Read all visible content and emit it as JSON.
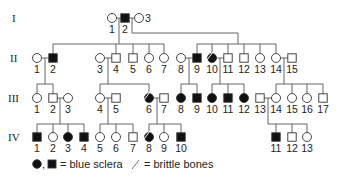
{
  "colors": {
    "affected": "#111111",
    "unaffected": "#ffffff",
    "line": "#555555",
    "text": "#222222"
  },
  "generations": [
    {
      "label": "I",
      "y": 18,
      "individuals": [
        {
          "id": "1",
          "sex": "female",
          "x": 112,
          "affected": false,
          "brittle": false
        },
        {
          "id": "2",
          "sex": "male",
          "x": 125,
          "affected": true,
          "brittle": false
        },
        {
          "id": "3",
          "sex": "female",
          "x": 139,
          "affected": false,
          "brittle": false,
          "label_side": "right"
        }
      ]
    },
    {
      "label": "II",
      "y": 58,
      "individuals": [
        {
          "id": "1",
          "sex": "female",
          "x": 37,
          "affected": false,
          "brittle": false
        },
        {
          "id": "2",
          "sex": "male",
          "x": 53,
          "affected": true,
          "brittle": false
        },
        {
          "id": "3",
          "sex": "female",
          "x": 100,
          "affected": false,
          "brittle": false
        },
        {
          "id": "4",
          "sex": "male",
          "x": 116,
          "affected": false,
          "brittle": false
        },
        {
          "id": "5",
          "sex": "male",
          "x": 133,
          "affected": false,
          "brittle": false
        },
        {
          "id": "6",
          "sex": "female",
          "x": 149,
          "affected": false,
          "brittle": false
        },
        {
          "id": "7",
          "sex": "female",
          "x": 164,
          "affected": false,
          "brittle": false
        },
        {
          "id": "8",
          "sex": "female",
          "x": 181,
          "affected": false,
          "brittle": false
        },
        {
          "id": "9",
          "sex": "male",
          "x": 197,
          "affected": true,
          "brittle": false
        },
        {
          "id": "10",
          "sex": "female",
          "x": 212,
          "affected": true,
          "brittle": true
        },
        {
          "id": "11",
          "sex": "male",
          "x": 228,
          "affected": false,
          "brittle": false
        },
        {
          "id": "12",
          "sex": "male",
          "x": 244,
          "affected": false,
          "brittle": false
        },
        {
          "id": "13",
          "sex": "female",
          "x": 260,
          "affected": false,
          "brittle": false
        },
        {
          "id": "14",
          "sex": "female",
          "x": 276,
          "affected": false,
          "brittle": false
        },
        {
          "id": "15",
          "sex": "male",
          "x": 292,
          "affected": false,
          "brittle": false
        }
      ]
    },
    {
      "label": "III",
      "y": 98,
      "individuals": [
        {
          "id": "1",
          "sex": "female",
          "x": 37,
          "affected": false,
          "brittle": false
        },
        {
          "id": "2",
          "sex": "male",
          "x": 53,
          "affected": false,
          "brittle": false
        },
        {
          "id": "3",
          "sex": "female",
          "x": 68,
          "affected": false,
          "brittle": false
        },
        {
          "id": "4",
          "sex": "female",
          "x": 100,
          "affected": false,
          "brittle": false
        },
        {
          "id": "5",
          "sex": "male",
          "x": 116,
          "affected": false,
          "brittle": false
        },
        {
          "id": "6",
          "sex": "female",
          "x": 149,
          "affected": true,
          "brittle": true
        },
        {
          "id": "7",
          "sex": "male",
          "x": 164,
          "affected": false,
          "brittle": false
        },
        {
          "id": "8",
          "sex": "female",
          "x": 181,
          "affected": true,
          "brittle": false
        },
        {
          "id": "9",
          "sex": "male",
          "x": 197,
          "affected": true,
          "brittle": false
        },
        {
          "id": "10",
          "sex": "female",
          "x": 212,
          "affected": true,
          "brittle": false
        },
        {
          "id": "11",
          "sex": "male",
          "x": 228,
          "affected": true,
          "brittle": false
        },
        {
          "id": "12",
          "sex": "female",
          "x": 244,
          "affected": true,
          "brittle": false
        },
        {
          "id": "13",
          "sex": "male",
          "x": 260,
          "affected": false,
          "brittle": false
        },
        {
          "id": "14",
          "sex": "female",
          "x": 276,
          "affected": false,
          "brittle": false
        },
        {
          "id": "15",
          "sex": "female",
          "x": 292,
          "affected": false,
          "brittle": false
        },
        {
          "id": "16",
          "sex": "female",
          "x": 307,
          "affected": false,
          "brittle": false
        },
        {
          "id": "17",
          "sex": "male",
          "x": 323,
          "affected": false,
          "brittle": false
        }
      ]
    },
    {
      "label": "IV",
      "y": 137,
      "individuals": [
        {
          "id": "1",
          "sex": "male",
          "x": 37,
          "affected": true,
          "brittle": false
        },
        {
          "id": "2",
          "sex": "female",
          "x": 53,
          "affected": false,
          "brittle": false
        },
        {
          "id": "3",
          "sex": "female",
          "x": 68,
          "affected": true,
          "brittle": false
        },
        {
          "id": "4",
          "sex": "male",
          "x": 84,
          "affected": true,
          "brittle": false
        },
        {
          "id": "5",
          "sex": "female",
          "x": 100,
          "affected": false,
          "brittle": false
        },
        {
          "id": "6",
          "sex": "female",
          "x": 116,
          "affected": false,
          "brittle": false
        },
        {
          "id": "7",
          "sex": "male",
          "x": 133,
          "affected": false,
          "brittle": false
        },
        {
          "id": "8",
          "sex": "female",
          "x": 149,
          "affected": true,
          "brittle": true
        },
        {
          "id": "9",
          "sex": "female",
          "x": 164,
          "affected": false,
          "brittle": false
        },
        {
          "id": "10",
          "sex": "male",
          "x": 181,
          "affected": true,
          "brittle": false
        },
        {
          "id": "11",
          "sex": "male",
          "x": 276,
          "affected": true,
          "brittle": false
        },
        {
          "id": "12",
          "sex": "male",
          "x": 292,
          "affected": false,
          "brittle": false
        },
        {
          "id": "13",
          "sex": "female",
          "x": 307,
          "affected": false,
          "brittle": false
        }
      ]
    }
  ],
  "legend": {
    "affected_text": "= blue sclera",
    "brittle_text": "= brittle bones"
  }
}
